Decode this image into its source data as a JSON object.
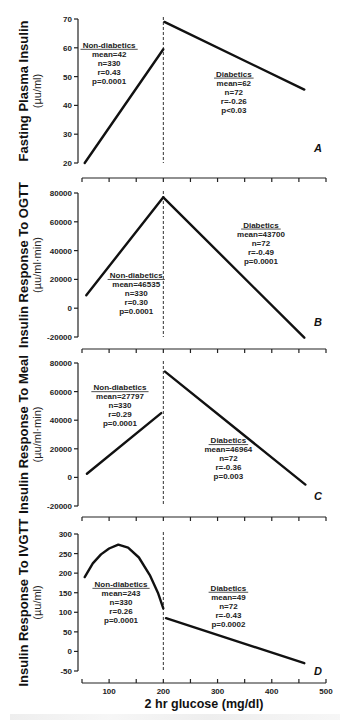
{
  "chart_data": [
    {
      "type": "line",
      "panel": "A",
      "ylabel": "Fasting Plasma Insulin",
      "yunit": "(µu/ml)",
      "ylim": [
        20,
        70
      ],
      "yticks": [
        20,
        30,
        40,
        50,
        60,
        70
      ],
      "xlim": [
        50,
        500
      ],
      "divider_x": 200,
      "series": [
        {
          "name": "Non-diabetics",
          "x": [
            55,
            200
          ],
          "y": [
            20,
            59.5
          ],
          "annotation": [
            "Non-diabetics",
            "mean=42",
            "n=330",
            "r=0.43",
            "p=0.0001"
          ],
          "annot_pos": [
            100,
            60
          ]
        },
        {
          "name": "Diabetics",
          "x": [
            202,
            460
          ],
          "y": [
            69,
            45.5
          ],
          "annotation": [
            "Diabetics",
            "mean=62",
            "n=72",
            "r=-0.26",
            "p<0.03"
          ],
          "annot_pos": [
            330,
            50
          ]
        }
      ]
    },
    {
      "type": "line",
      "panel": "B",
      "ylabel": "Insulin Response To OGTT",
      "yunit": "(µu/ml·min)",
      "ylim": [
        -20000,
        80000
      ],
      "yticks": [
        -20000,
        0,
        20000,
        40000,
        60000,
        80000
      ],
      "xlim": [
        50,
        500
      ],
      "divider_x": 200,
      "series": [
        {
          "name": "Non-diabetics",
          "x": [
            58,
            200
          ],
          "y": [
            9000,
            77000
          ],
          "annotation": [
            "Non-diabetics",
            "mean=46535",
            "n=330",
            "r=0.30",
            "p=0.0001"
          ],
          "annot_pos": [
            150,
            21000
          ]
        },
        {
          "name": "Diabetics",
          "x": [
            200,
            460
          ],
          "y": [
            77000,
            -20500
          ],
          "annotation": [
            "Diabetics",
            "mean=43700",
            "n=72",
            "r=-0.49",
            "p=0.0001"
          ],
          "annot_pos": [
            380,
            56000
          ]
        }
      ]
    },
    {
      "type": "line",
      "panel": "C",
      "ylabel": "Insulin Response To Meal",
      "yunit": "(µu/ml·min)",
      "ylim": [
        -20000,
        80000
      ],
      "yticks": [
        -20000,
        0,
        20000,
        40000,
        60000,
        80000
      ],
      "xlim": [
        50,
        500
      ],
      "divider_x": 200,
      "series": [
        {
          "name": "Non-diabetics",
          "x": [
            59,
            196
          ],
          "y": [
            2500,
            45000
          ],
          "annotation": [
            "Non-diabetics",
            "mean=27797",
            "n=330",
            "r=0.29",
            "p=0.0001"
          ],
          "annot_pos": [
            120,
            61000
          ]
        },
        {
          "name": "Diabetics",
          "x": [
            203,
            462
          ],
          "y": [
            74000,
            -5000
          ],
          "annotation": [
            "Diabetics",
            "mean=46964",
            "n=72",
            "r=-0.36",
            "p=0.003"
          ],
          "annot_pos": [
            320,
            24000
          ]
        }
      ]
    },
    {
      "type": "line",
      "panel": "D",
      "ylabel": "Insulin Response To IVGTT",
      "yunit": "(µu/ml)",
      "ylim": [
        -50,
        300
      ],
      "yticks": [
        -50,
        0,
        50,
        100,
        150,
        200,
        250,
        300
      ],
      "xlim": [
        50,
        500
      ],
      "xticks": [
        100,
        200,
        300,
        400,
        500
      ],
      "xlabel": "2 hr glucose (mg/dl)",
      "divider_x": 200,
      "series": [
        {
          "name": "Non-diabetics",
          "x": [
            55,
            70,
            85,
            100,
            117,
            135,
            155,
            175,
            190,
            200
          ],
          "y": [
            190,
            225,
            248,
            263,
            273,
            265,
            240,
            195,
            150,
            110
          ],
          "annotation": [
            "Non-diabetics",
            "mean=243",
            "n=330",
            "r=0.26",
            "p=0.0001"
          ],
          "annot_pos": [
            122,
            165
          ]
        },
        {
          "name": "Diabetics",
          "x": [
            205,
            460
          ],
          "y": [
            85,
            -30
          ],
          "annotation": [
            "Diabetics",
            "mean=49",
            "n=72",
            "r=-0.43",
            "p=0.0002"
          ],
          "annot_pos": [
            320,
            155
          ]
        }
      ]
    }
  ],
  "panel_letters": [
    "A",
    "B",
    "C",
    "D"
  ],
  "xlabel": "2 hr glucose (mg/dl)"
}
